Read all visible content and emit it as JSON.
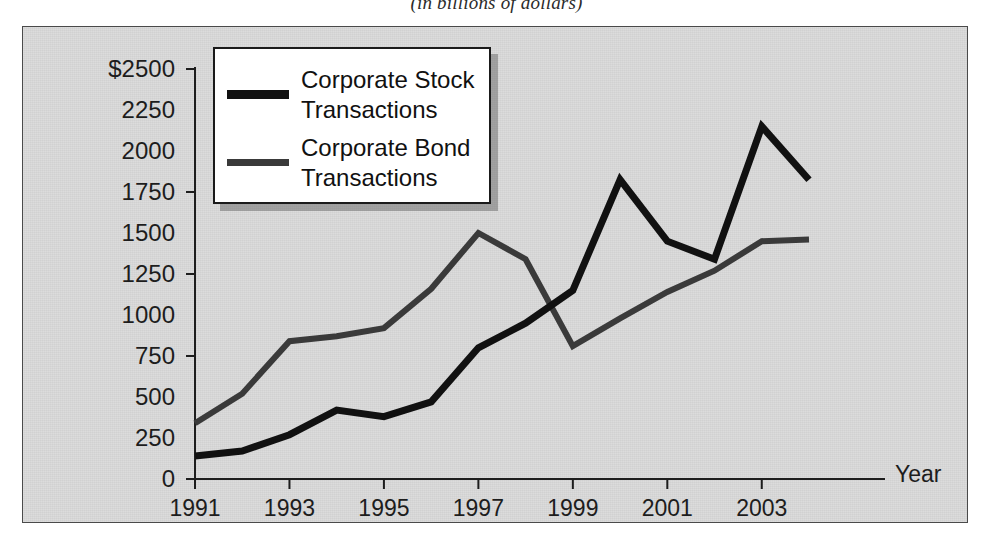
{
  "caption": "(in billions of dollars)",
  "axes": {
    "y_ticks": [
      "$2500",
      "2250",
      "2000",
      "1750",
      "1500",
      "1250",
      "1000",
      "750",
      "500",
      "250",
      "0"
    ],
    "y_values": [
      2500,
      2250,
      2000,
      1750,
      1500,
      1250,
      1000,
      750,
      500,
      250,
      0
    ],
    "y_major_ticks": [
      2500,
      1750,
      1250,
      750,
      0
    ],
    "x_ticks": [
      "1991",
      "1993",
      "1995",
      "1997",
      "1999",
      "2001",
      "2003"
    ],
    "x_values": [
      1991,
      1993,
      1995,
      1997,
      1999,
      2001,
      2003
    ],
    "x_axis_name": "Year"
  },
  "legend": {
    "position": "inside-top-left",
    "entries": [
      {
        "label": "Corporate Stock\nTransactions",
        "color": "#111111",
        "width": 9
      },
      {
        "label": "Corporate Bond\nTransactions",
        "color": "#3a3a3a",
        "width": 7
      }
    ]
  },
  "colors": {
    "panel_background": "#d8d8d8",
    "panel_border": "#4a4a4a",
    "page_background": "#ffffff",
    "stock_line": "#111111",
    "bond_line": "#3a3a3a",
    "axis": "#1d1d1d",
    "text": "#1d1d1d"
  },
  "chart_data": {
    "type": "line",
    "title": "(in billions of dollars)",
    "xlabel": "Year",
    "ylabel": "",
    "xlim": [
      1991,
      2004
    ],
    "ylim": [
      0,
      2500
    ],
    "grid": false,
    "legend_position": "upper left (inside plot)",
    "x": [
      1991,
      1992,
      1993,
      1994,
      1995,
      1996,
      1997,
      1998,
      1999,
      2000,
      2001,
      2002,
      2003,
      2004
    ],
    "series": [
      {
        "name": "Corporate Stock Transactions",
        "color": "#111111",
        "values": [
          140,
          170,
          270,
          420,
          380,
          470,
          800,
          950,
          1150,
          1825,
          1450,
          1340,
          2150,
          1825
        ]
      },
      {
        "name": "Corporate Bond Transactions",
        "color": "#3a3a3a",
        "values": [
          340,
          520,
          840,
          870,
          920,
          1160,
          1500,
          1340,
          810,
          980,
          1140,
          1270,
          1450,
          1460
        ]
      }
    ],
    "units": "billions of dollars",
    "y_tick_labels": [
      "0",
      "250",
      "500",
      "750",
      "1000",
      "1250",
      "1500",
      "1750",
      "2000",
      "2250",
      "$2500"
    ],
    "x_tick_labels": [
      "1991",
      "1993",
      "1995",
      "1997",
      "1999",
      "2001",
      "2003"
    ]
  }
}
